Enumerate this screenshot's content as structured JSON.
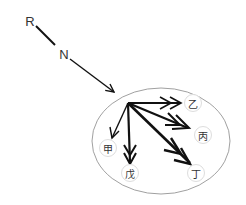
{
  "diagram": {
    "labels": {
      "r": "R",
      "n": "N"
    },
    "nodes": {
      "yi": "乙",
      "bing": "丙",
      "ding": "丁",
      "wu": "戊",
      "jia": "甲"
    },
    "colors": {
      "line": "#111111",
      "ellipse": "#888888",
      "node_border": "#dddddd"
    }
  }
}
